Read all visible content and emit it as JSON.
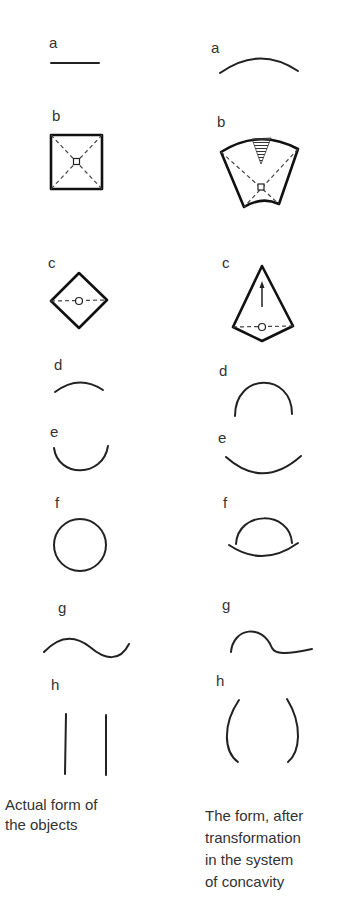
{
  "columns": {
    "left": {
      "caption_line1": "Actual form of",
      "caption_line2": "the objects"
    },
    "right": {
      "caption_line1": "The form, after",
      "caption_line2": "transformation",
      "caption_line3": "in the system",
      "caption_line4": "of concavity"
    }
  },
  "items": [
    {
      "id": "a",
      "label": "a",
      "actual": "straight horizontal line",
      "transformed": "upward convex arc"
    },
    {
      "id": "b",
      "label": "b",
      "actual": "square with dashed diagonals and center point",
      "transformed": "curved fan-shaped quadrilateral with shaded triangle and dashed diagonals"
    },
    {
      "id": "c",
      "label": "c",
      "actual": "diamond with dashed horizontal axis and center circle",
      "transformed": "kite shape with upward arrow and dashed base axis"
    },
    {
      "id": "d",
      "label": "d",
      "actual": "shallow upward arc",
      "transformed": "tall semicircular arc"
    },
    {
      "id": "e",
      "label": "e",
      "actual": "downward U arc",
      "transformed": "wide shallow downward arc"
    },
    {
      "id": "f",
      "label": "f",
      "actual": "circle",
      "transformed": "dome arc over shallow bowl arc"
    },
    {
      "id": "g",
      "label": "g",
      "actual": "sine wave",
      "transformed": "hump followed by shallow dip"
    },
    {
      "id": "h",
      "label": "h",
      "actual": "two parallel vertical lines",
      "transformed": "pair of outward parentheses curves"
    }
  ]
}
